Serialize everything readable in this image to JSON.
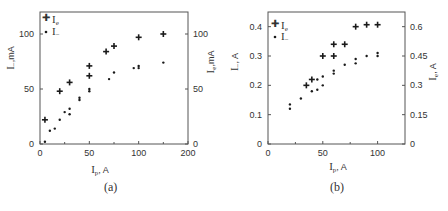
{
  "chart_data": [
    {
      "type": "scatter",
      "panel_label": "(a)",
      "xlabel": "I_p, A",
      "ylabel_left": "I_-, mA",
      "ylabel_right": "I_e, mA",
      "xlim": [
        0,
        150
      ],
      "x_ticks": [
        0,
        50,
        100,
        150
      ],
      "x_tick_labels": [
        "0",
        "50",
        "100",
        "200"
      ],
      "ylim_left": [
        0,
        120
      ],
      "y_ticks_left": [
        0,
        50,
        100
      ],
      "ylim_right": [
        0,
        120
      ],
      "y_ticks_right": [
        0,
        50,
        100
      ],
      "grid": false,
      "legend_position": "upper-left",
      "series": [
        {
          "name": "I_e",
          "marker": "plus",
          "axis": "right",
          "x": [
            5,
            20,
            30,
            50,
            50,
            67,
            75,
            100,
            125
          ],
          "y": [
            22,
            48,
            56,
            62,
            71,
            84,
            89,
            97,
            100
          ]
        },
        {
          "name": "I_-",
          "marker": "dot",
          "axis": "left",
          "x": [
            5,
            10,
            15,
            20,
            25,
            30,
            30,
            40,
            40,
            50,
            50,
            70,
            75,
            95,
            100,
            100,
            125
          ],
          "y": [
            2,
            12,
            14,
            22,
            29,
            27,
            32,
            40,
            42,
            48,
            50,
            59,
            65,
            69,
            69,
            71,
            74
          ]
        }
      ]
    },
    {
      "type": "scatter",
      "panel_label": "(b)",
      "xlabel": "I_p, A",
      "ylabel_left": "I_-, A",
      "ylabel_right": "I_e, A",
      "xlim": [
        0,
        125
      ],
      "x_ticks": [
        0,
        50,
        100
      ],
      "x_tick_labels": [
        "0",
        "50",
        "100"
      ],
      "ylim_left": [
        0,
        0.45
      ],
      "y_ticks_left": [
        0,
        0.1,
        0.2,
        0.3,
        0.4
      ],
      "ylim_right": [
        0,
        0.675
      ],
      "y_ticks_right": [
        0,
        0.15,
        0.3,
        0.45,
        0.6
      ],
      "grid": false,
      "legend_position": "upper-left",
      "series": [
        {
          "name": "I_e",
          "marker": "plus",
          "axis": "right",
          "x": [
            35,
            40,
            50,
            60,
            60,
            70,
            80,
            90,
            100
          ],
          "y": [
            0.3,
            0.33,
            0.45,
            0.45,
            0.51,
            0.51,
            0.6,
            0.61,
            0.61
          ]
        },
        {
          "name": "I_-",
          "marker": "dot",
          "axis": "left",
          "x": [
            20,
            20,
            30,
            40,
            45,
            45,
            50,
            50,
            60,
            60,
            70,
            80,
            80,
            90,
            100,
            100
          ],
          "y": [
            0.12,
            0.135,
            0.155,
            0.18,
            0.185,
            0.22,
            0.2,
            0.23,
            0.24,
            0.25,
            0.27,
            0.275,
            0.29,
            0.3,
            0.3,
            0.31
          ]
        }
      ]
    }
  ],
  "panels": {
    "a": {
      "caption": "(a)",
      "xlabel_main": "I",
      "xlabel_sub": "p",
      "xlabel_unit": ", A",
      "ylabel_left_main": "I",
      "ylabel_left_sub": "−",
      "ylabel_left_unit": ",mA",
      "ylabel_right_main": "I",
      "ylabel_right_sub": "e",
      "ylabel_right_unit": ",mA",
      "legend": [
        {
          "main": "I",
          "sub": "e"
        },
        {
          "main": "I",
          "sub": "−"
        }
      ],
      "x_tick_labels": [
        "0",
        "50",
        "100",
        "200"
      ],
      "y_left_tick_labels": [
        "0",
        "50",
        "100"
      ],
      "y_right_tick_labels": [
        "0",
        "50",
        "100"
      ]
    },
    "b": {
      "caption": "(b)",
      "xlabel_main": "I",
      "xlabel_sub": "p",
      "xlabel_unit": ", A",
      "ylabel_left_main": "I",
      "ylabel_left_sub": "−",
      "ylabel_left_unit": ", A",
      "ylabel_right_main": "I",
      "ylabel_right_sub": "e",
      "ylabel_right_unit": ", A",
      "legend": [
        {
          "main": "I",
          "sub": "e"
        },
        {
          "main": "I",
          "sub": "−"
        }
      ],
      "x_tick_labels": [
        "0",
        "50",
        "100"
      ],
      "y_left_tick_labels": [
        "0",
        "0.1",
        "0.2",
        "0.3",
        "0.4"
      ],
      "y_right_tick_labels": [
        "0",
        "0.15",
        "0.3",
        "0.45",
        "0.6"
      ]
    }
  },
  "colors": {
    "axis": "#555555",
    "marker": "#1a1a1a",
    "text": "#333333"
  }
}
